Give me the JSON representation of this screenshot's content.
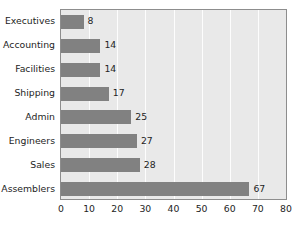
{
  "chart_data": {
    "type": "bar",
    "orientation": "horizontal",
    "title": "",
    "xlabel": "",
    "ylabel": "",
    "xlim": [
      0,
      80
    ],
    "xticks": [
      0,
      10,
      20,
      30,
      40,
      50,
      60,
      70,
      80
    ],
    "grid": true,
    "legend": false,
    "categories": [
      "Executives",
      "Accounting",
      "Facilities",
      "Shipping",
      "Admin",
      "Engineers",
      "Sales",
      "Assemblers"
    ],
    "values": [
      8,
      14,
      14,
      17,
      25,
      27,
      28,
      67
    ],
    "data_labels": [
      "8",
      "14",
      "14",
      "17",
      "25",
      "27",
      "28",
      "67"
    ],
    "colors": {
      "bar": "#818181",
      "plot_background": "#e9e9e9",
      "gridline": "#fdfdfd",
      "plot_border": "#8d8d8d",
      "text": "#242424",
      "page_background": "#ffffff"
    }
  }
}
